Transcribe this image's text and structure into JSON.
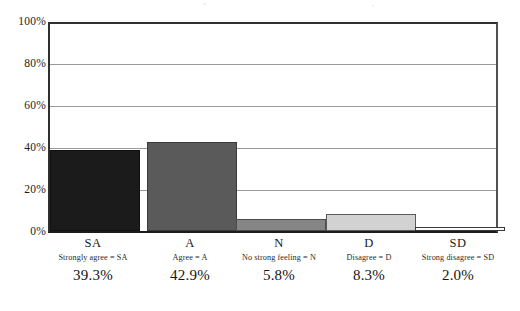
{
  "chart_data": {
    "type": "bar",
    "title": "",
    "subtitle": "",
    "xlabel": "",
    "ylabel": "",
    "categories": [
      "SA",
      "A",
      "N",
      "D",
      "SD"
    ],
    "values": [
      39.3,
      42.9,
      5.8,
      8.3,
      2.0
    ],
    "value_labels": [
      "39.3%",
      "42.9%",
      "5.8%",
      "8.3%",
      "2.0%"
    ],
    "category_legends": [
      "Strongly agree = SA",
      "Agree = A",
      "No strong feeling = N",
      "Disagree = D",
      "Strong disagree = SD"
    ],
    "bar_colors": [
      "#1b1b1b",
      "#5a5a5a",
      "#868686",
      "#d2d2d2",
      "#fbfbfb"
    ],
    "bar_border_colors": [
      "#111111",
      "#3a3a3a",
      "#4c4c4c",
      "#5a5a5a",
      "#3a3a3a"
    ],
    "ylim": [
      0,
      100
    ],
    "yticks": [
      0,
      20,
      40,
      60,
      80,
      100
    ],
    "ytick_labels": [
      "0%",
      "20%",
      "40%",
      "60%",
      "80%",
      "100%"
    ],
    "grid": true,
    "grid_axis": "y",
    "legend": "none",
    "axis_color": "#303030",
    "grid_color": "#9a9a9a",
    "background_color": "#ffffff"
  },
  "axis": {
    "y_tick_0": "0%",
    "y_tick_1": "20%",
    "y_tick_2": "40%",
    "y_tick_3": "60%",
    "y_tick_4": "80%",
    "y_tick_5": "100%"
  },
  "bars": [
    {
      "code": "SA",
      "legend": "Strongly agree = SA",
      "value_label": "39.3%"
    },
    {
      "code": "A",
      "legend": "Agree = A",
      "value_label": "42.9%"
    },
    {
      "code": "N",
      "legend": "No strong feeling = N",
      "value_label": "5.8%"
    },
    {
      "code": "D",
      "legend": "Disagree = D",
      "value_label": "8.3%"
    },
    {
      "code": "SD",
      "legend": "Strong disagree = SD",
      "value_label": "2.0%"
    }
  ]
}
